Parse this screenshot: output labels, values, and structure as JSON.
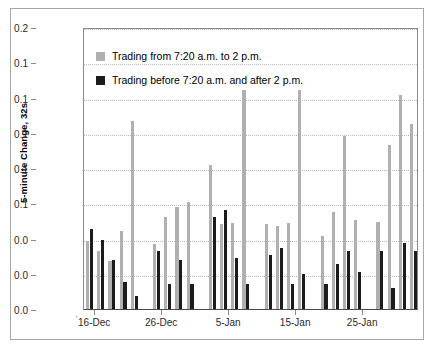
{
  "chart_data": {
    "type": "bar",
    "title": "",
    "xlabel": "",
    "ylabel": "5-minute Change, 32s",
    "ylim": [
      0,
      0.2
    ],
    "grid": true,
    "legend_position": "top-left",
    "y_ticks": [
      {
        "value": 0.2,
        "label": "0.2"
      },
      {
        "value": 0.175,
        "label": "0.1"
      },
      {
        "value": 0.15,
        "label": "0.1"
      },
      {
        "value": 0.125,
        "label": "0.1"
      },
      {
        "value": 0.1,
        "label": "0.1"
      },
      {
        "value": 0.075,
        "label": "0.1"
      },
      {
        "value": 0.05,
        "label": "0.0"
      },
      {
        "value": 0.025,
        "label": "0.0"
      },
      {
        "value": 0.0,
        "label": "0.0"
      }
    ],
    "x_tick_labels": [
      "16-Dec",
      "26-Dec",
      "5-Jan",
      "15-Jan",
      "25-Jan"
    ],
    "x_tick_positions": [
      0.5,
      6.5,
      12.5,
      18.5,
      24.5
    ],
    "categories": [
      "16-Dec",
      "17-Dec",
      "18-Dec",
      "19-Dec",
      "20-Dec",
      "23-Dec",
      "24-Dec",
      "26-Dec",
      "27-Dec",
      "30-Dec",
      "2-Jan",
      "3-Jan",
      "6-Jan",
      "7-Jan",
      "8-Jan",
      "9-Jan",
      "10-Jan",
      "13-Jan",
      "14-Jan",
      "15-Jan",
      "16-Jan",
      "17-Jan",
      "21-Jan",
      "22-Jan",
      "23-Jan",
      "24-Jan",
      "27-Jan",
      "28-Jan",
      "29-Jan",
      "30-Jan"
    ],
    "series": [
      {
        "name": "Trading from 7:20 a.m. to 2 p.m.",
        "color": "#b0b0b0",
        "values": [
          0.048,
          0.041,
          0.034,
          0.055,
          0.133,
          null,
          0.046,
          0.065,
          0.072,
          0.076,
          null,
          0.102,
          0.06,
          0.061,
          0.155,
          null,
          0.06,
          0.059,
          0.061,
          0.155,
          null,
          0.052,
          0.069,
          0.123,
          0.063,
          null,
          0.062,
          0.116,
          0.152,
          0.131
        ]
      },
      {
        "name": "Trading before 7:20 a.m. and after 2 p.m.",
        "color": "#1c1c1c",
        "values": [
          0.057,
          0.049,
          0.035,
          0.019,
          0.009,
          null,
          0.041,
          0.018,
          0.035,
          0.018,
          null,
          0.065,
          0.07,
          0.036,
          0.018,
          null,
          0.038,
          0.043,
          0.018,
          0.025,
          null,
          0.018,
          0.032,
          0.041,
          0.026,
          null,
          0.041,
          0.015,
          0.047,
          0.041
        ]
      }
    ]
  },
  "legend": {
    "entries": [
      {
        "label": "Trading from 7:20 a.m. to 2 p.m."
      },
      {
        "label": "Trading before 7:20 a.m. and after 2 p.m."
      }
    ]
  },
  "axis": {
    "y_title": "5-minute Change, 32s",
    "origin_mark": "'"
  }
}
